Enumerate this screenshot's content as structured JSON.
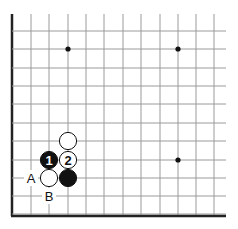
{
  "diagram": {
    "type": "go-board-corner",
    "corner": "bottom-left",
    "grid": {
      "x_lines": [
        12,
        31,
        49,
        68,
        86,
        104,
        123,
        141,
        160,
        178,
        196,
        214
      ],
      "y_lines": [
        31,
        49,
        68,
        86,
        104,
        123,
        141,
        160,
        178,
        196,
        214
      ],
      "top_extent": 14,
      "right_extent": 226,
      "edge_left_x": 12,
      "edge_bottom_y": 216
    },
    "star_points": [
      {
        "x": 68,
        "y": 49
      },
      {
        "x": 178,
        "y": 49
      },
      {
        "x": 178,
        "y": 160
      }
    ],
    "stones": [
      {
        "color": "white",
        "x": 68,
        "y": 141,
        "label": ""
      },
      {
        "color": "black",
        "x": 49,
        "y": 160,
        "label": "1"
      },
      {
        "color": "white",
        "x": 68,
        "y": 160,
        "label": "2"
      },
      {
        "color": "white",
        "x": 49,
        "y": 178,
        "label": ""
      },
      {
        "color": "black",
        "x": 68,
        "y": 178,
        "label": ""
      }
    ],
    "markers": [
      {
        "label": "A",
        "x": 31,
        "y": 178
      },
      {
        "label": "B",
        "x": 49,
        "y": 196
      }
    ],
    "colors": {
      "line": "#9a9a9a",
      "edge": "#222222",
      "black_stone": "#111111",
      "white_stone": "#ffffff",
      "background": "#ffffff"
    }
  }
}
